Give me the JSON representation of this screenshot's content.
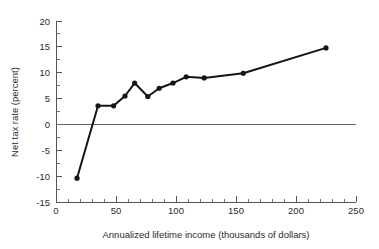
{
  "chart_data": {
    "type": "line",
    "title": "",
    "xlabel": "Annualized lifetime income (thousands of dollars)",
    "ylabel": "Net tax rate (percent)",
    "xlim": [
      0,
      250
    ],
    "ylim": [
      -15,
      20
    ],
    "grid": false,
    "legend": "none",
    "x_ticks": [
      0,
      50,
      100,
      150,
      200,
      250
    ],
    "x_tick_labels": [
      "0",
      "50",
      "100",
      "150",
      "200",
      "250"
    ],
    "x_minor_step": 10,
    "y_ticks": [
      -15,
      -10,
      -5,
      0,
      5,
      10,
      15,
      20
    ],
    "y_tick_labels": [
      "-15",
      "-10",
      "-5",
      "0",
      "5",
      "10",
      "15",
      "20"
    ],
    "y_minor_step": 2.5,
    "zero_line": 0,
    "series": [
      {
        "name": "Net tax rate",
        "color": "#151515",
        "marker": "circle",
        "x": [
          17.5,
          35,
          48,
          57.5,
          65.5,
          76.5,
          86,
          97.5,
          108.5,
          123.5,
          156,
          225
        ],
        "y": [
          -10.4,
          3.6,
          3.6,
          5.5,
          8.0,
          5.4,
          7.0,
          8.0,
          9.2,
          9.0,
          9.9,
          14.8
        ]
      }
    ]
  },
  "axis": {
    "x_label": "Annualized lifetime income (thousands of dollars)",
    "y_label": "Net tax rate (percent)"
  }
}
